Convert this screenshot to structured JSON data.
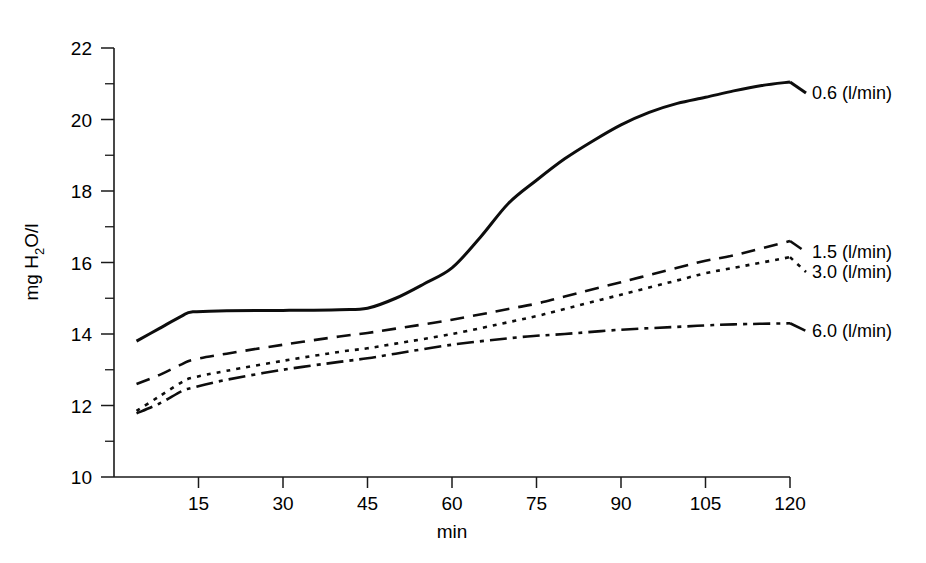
{
  "chart_data": {
    "type": "line",
    "title": "",
    "xlabel": "min",
    "ylabel": "mg H2O/l",
    "ylabel_parts": {
      "prefix": "mg H",
      "sub": "2",
      "suffix": "O/l"
    },
    "xlim": [
      0,
      120
    ],
    "ylim": [
      10,
      22
    ],
    "x_ticks": [
      15,
      30,
      45,
      60,
      75,
      90,
      105,
      120
    ],
    "y_ticks": [
      10,
      12,
      14,
      16,
      18,
      20,
      22
    ],
    "y_minor_ticks": [
      11,
      13,
      15,
      17,
      19,
      21
    ],
    "grid": false,
    "legend_position": "right-of-line-ends",
    "x_units": "min",
    "y_units": "mg H2O/l",
    "series": [
      {
        "name": "0.6 (l/min)",
        "label": "0.6 (l/min)",
        "flow": "0.6",
        "line_style": "solid",
        "label_y_px": 93,
        "x": [
          4,
          8,
          12,
          14,
          20,
          30,
          40,
          45,
          50,
          55,
          60,
          65,
          70,
          75,
          80,
          85,
          90,
          95,
          100,
          105,
          110,
          115,
          120
        ],
        "values": [
          13.8,
          14.15,
          14.5,
          14.62,
          14.65,
          14.66,
          14.68,
          14.72,
          15.0,
          15.4,
          15.85,
          16.7,
          17.65,
          18.3,
          18.9,
          19.4,
          19.85,
          20.2,
          20.45,
          20.62,
          20.8,
          20.95,
          21.05
        ]
      },
      {
        "name": "1.5 (l/min)",
        "label": "1.5 (l/min)",
        "flow": "1.5",
        "line_style": "dashed",
        "label_y_px": 252,
        "x": [
          4,
          8,
          12,
          14,
          20,
          30,
          40,
          45,
          50,
          60,
          70,
          75,
          80,
          90,
          100,
          105,
          110,
          120
        ],
        "values": [
          12.6,
          12.85,
          13.15,
          13.28,
          13.45,
          13.7,
          13.93,
          14.03,
          14.15,
          14.4,
          14.7,
          14.85,
          15.05,
          15.45,
          15.85,
          16.05,
          16.2,
          16.6
        ]
      },
      {
        "name": "3.0 (l/min)",
        "label": "3.0 (l/min)",
        "flow": "3.0",
        "line_style": "dotted",
        "label_y_px": 272,
        "x": [
          4,
          8,
          12,
          14,
          20,
          30,
          40,
          45,
          50,
          60,
          70,
          75,
          80,
          90,
          100,
          105,
          110,
          120
        ],
        "values": [
          11.85,
          12.25,
          12.65,
          12.78,
          12.97,
          13.25,
          13.5,
          13.6,
          13.73,
          14.0,
          14.33,
          14.5,
          14.7,
          15.1,
          15.5,
          15.7,
          15.85,
          16.15
        ]
      },
      {
        "name": "6.0 (l/min)",
        "label": "6.0 (l/min)",
        "flow": "6.0",
        "line_style": "dashdot",
        "label_y_px": 331,
        "x": [
          4,
          8,
          12,
          14,
          20,
          30,
          40,
          45,
          50,
          60,
          70,
          75,
          80,
          90,
          100,
          105,
          110,
          120
        ],
        "values": [
          11.78,
          12.05,
          12.4,
          12.5,
          12.72,
          13.0,
          13.22,
          13.32,
          13.45,
          13.7,
          13.88,
          13.95,
          14.0,
          14.12,
          14.2,
          14.24,
          14.27,
          14.3
        ]
      }
    ]
  },
  "axes": {
    "x_title": "min",
    "y_title_prefix": "mg H",
    "y_title_sub": "2",
    "y_title_suffix": "O/l"
  }
}
